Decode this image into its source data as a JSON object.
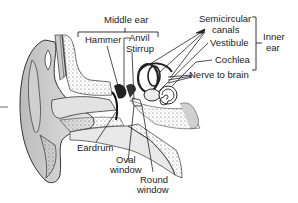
{
  "diagram": {
    "type": "anatomy",
    "subject": "ear",
    "groups": {
      "middle_ear": "Middle ear",
      "inner_ear_line1": "Inner",
      "inner_ear_line2": "ear"
    },
    "labels": {
      "hammer": "Hammer",
      "anvil": "Anvil",
      "stirrup": "Stirrup",
      "semicircular_line1": "Semicircular",
      "semicircular_line2": "canals",
      "vestibule": "Vestibule",
      "cochlea": "Cochlea",
      "nerve": "Nerve to brain",
      "eardrum": "Eardrum",
      "oval_line1": "Oval",
      "oval_line2": "window",
      "round_line1": "Round",
      "round_line2": "window"
    },
    "colors": {
      "ink": "#222222",
      "tissue": "#d8d8d8",
      "background": "#ffffff"
    }
  }
}
